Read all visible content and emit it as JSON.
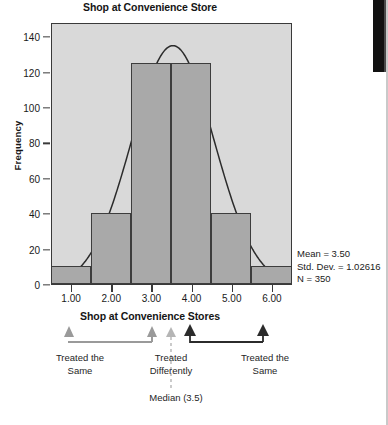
{
  "chart_title": "Shop at Convenience Store",
  "axis_title_bottom": "Shop at Convenience Stores",
  "ylabel": "Frequency",
  "stats": {
    "mean_line": "Mean = 3.50",
    "stddev_line": "Std. Dev. = 1.02616",
    "n_line": "N = 350"
  },
  "annotations": {
    "left_label_line1": "Treated the",
    "left_label_line2": "Same",
    "center_label_line1": "Treated",
    "center_label_line2": "Differently",
    "right_label_line1": "Treated the",
    "right_label_line2": "Same",
    "median_label": "Median (3.5)"
  },
  "colors": {
    "plot_background": "#d9d9d9",
    "bar_fill": "#a9a9a9",
    "bar_border": "#3d3d3d",
    "curve": "#2b2b2b",
    "arrow_light": "#9a9a9a",
    "arrow_dark": "#2b2b2b"
  },
  "chart_data": {
    "type": "bar",
    "title": "Shop at Convenience Store",
    "subtitle": "",
    "xlabel": "Shop at Convenience Stores",
    "ylabel": "Frequency",
    "categories": [
      "1.00",
      "2.00",
      "3.00",
      "4.00",
      "5.00",
      "6.00"
    ],
    "x": [
      1,
      2,
      3,
      4,
      5,
      6
    ],
    "values": [
      10,
      40,
      125,
      125,
      40,
      10
    ],
    "xlim": [
      0.5,
      6.5
    ],
    "ylim": [
      0,
      148
    ],
    "ytick_values": [
      0,
      20,
      40,
      60,
      80,
      100,
      120,
      140
    ],
    "ytick_labels": [
      "0",
      "20",
      "40",
      "60",
      "80",
      "100",
      "120",
      "140"
    ],
    "xtick_values": [
      1,
      2,
      3,
      4,
      5,
      6
    ],
    "xtick_labels": [
      "1.00",
      "2.00",
      "3.00",
      "4.00",
      "5.00",
      "6.00"
    ],
    "grid": false,
    "legend": false,
    "overlay": {
      "type": "line",
      "name": "normal curve",
      "mean": 3.5,
      "std_dev": 1.02616,
      "n": 350,
      "peak_value": 136
    },
    "statistics": {
      "mean": 3.5,
      "std_dev": 1.02616,
      "n": 350,
      "median": 3.5
    },
    "annotation_markers": [
      {
        "label": "Treated the Same",
        "x": 1.0,
        "style": "light"
      },
      {
        "label": "Treated Differently",
        "x": 3.1,
        "style": "light"
      },
      {
        "label": "Median (3.5)",
        "x": 3.5,
        "style": "dotted"
      },
      {
        "label": "Treated Differently",
        "x": 3.9,
        "style": "dark"
      },
      {
        "label": "Treated the Same",
        "x": 5.9,
        "style": "dark"
      }
    ]
  }
}
